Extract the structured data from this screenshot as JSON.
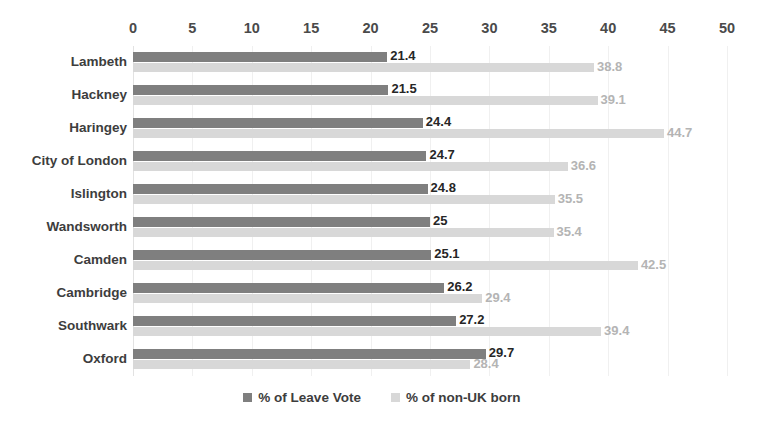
{
  "chart_data": {
    "type": "bar",
    "orientation": "horizontal",
    "title": "",
    "xlabel": "",
    "ylabel": "",
    "xlim": [
      0,
      50
    ],
    "xticks": [
      0,
      5,
      10,
      15,
      20,
      25,
      30,
      35,
      40,
      45,
      50
    ],
    "grid": true,
    "grid_axis": "x",
    "legend_position": "bottom",
    "categories": [
      "Lambeth",
      "Hackney",
      "Haringey",
      "City of London",
      "Islington",
      "Wandsworth",
      "Camden",
      "Cambridge",
      "Southwark",
      "Oxford"
    ],
    "series": [
      {
        "name": "% of Leave Vote",
        "color": "#7f7f7f",
        "label_color": "#262626",
        "values": [
          21.4,
          21.5,
          24.4,
          24.7,
          24.8,
          25,
          25.1,
          26.2,
          27.2,
          29.7
        ],
        "labels": [
          "21.4",
          "21.5",
          "24.4",
          "24.7",
          "24.8",
          "25",
          "25.1",
          "26.2",
          "27.2",
          "29.7"
        ]
      },
      {
        "name": "% of non-UK born",
        "color": "#d8d8d8",
        "label_color": "#b4b4b4",
        "values": [
          38.8,
          39.1,
          44.7,
          36.6,
          35.5,
          35.4,
          42.5,
          29.4,
          39.4,
          28.4
        ],
        "labels": [
          "38.8",
          "39.1",
          "44.7",
          "36.6",
          "35.5",
          "35.4",
          "42.5",
          "29.4",
          "39.4",
          "28.4"
        ]
      }
    ]
  },
  "legend": [
    {
      "label": "% of Leave Vote",
      "color": "#7f7f7f"
    },
    {
      "label": "% of non-UK born",
      "color": "#d8d8d8"
    }
  ],
  "colors": {
    "leave_vote": "#7f7f7f",
    "non_uk_born": "#d8d8d8",
    "gridline": "#f0f0f0",
    "axis": "#e2e2e2",
    "text": "#3d3d3d"
  }
}
